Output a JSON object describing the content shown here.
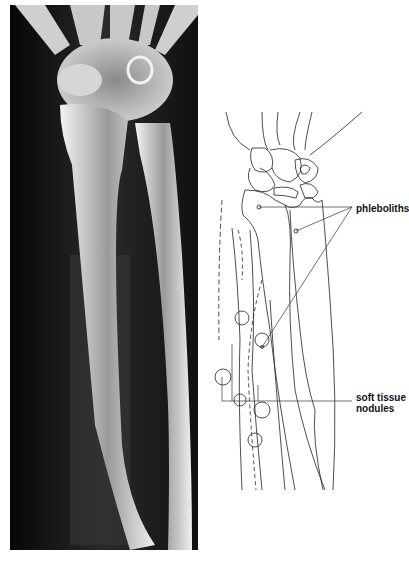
{
  "figure": {
    "left_panel": "radiograph of forearm and wrist",
    "right_panel": "line drawing tracing of radiograph",
    "labels": {
      "phleboliths": "phleboliths",
      "soft_tissue_nodules_line1": "soft tissue",
      "soft_tissue_nodules_line2": "nodules"
    },
    "colors": {
      "background": "#ffffff",
      "xray_dark": "#0d0d0d",
      "bone": "#e8e8e8",
      "line": "#222222"
    }
  }
}
